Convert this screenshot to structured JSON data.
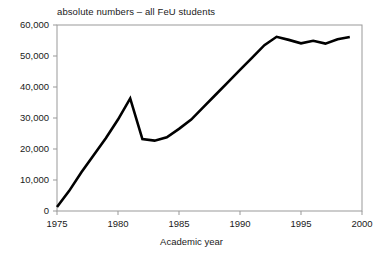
{
  "chart_data": {
    "type": "line",
    "title": "absolute numbers – all FeU students",
    "xlabel": "Academic year",
    "ylabel": "",
    "xlim": [
      1975,
      2000
    ],
    "ylim": [
      0,
      60000
    ],
    "grid": false,
    "legend": "none",
    "xticks": [
      1975,
      1980,
      1985,
      1990,
      1995,
      2000
    ],
    "xtick_labels": [
      "1975",
      "1980",
      "1985",
      "1990",
      "1995",
      "2000"
    ],
    "yticks": [
      0,
      10000,
      20000,
      30000,
      40000,
      50000,
      60000
    ],
    "ytick_labels": [
      "0",
      "10,000",
      "20,000",
      "30,000",
      "40,000",
      "50,000",
      "60,000"
    ],
    "line_color": "#000000",
    "line_width": 2.6,
    "x": [
      1975,
      1976,
      1977,
      1978,
      1979,
      1980,
      1981,
      1982,
      1983,
      1984,
      1985,
      1986,
      1987,
      1988,
      1989,
      1990,
      1991,
      1992,
      1993,
      1994,
      1995,
      1996,
      1997,
      1998,
      1999
    ],
    "values": [
      1300,
      6500,
      12500,
      18000,
      23500,
      29500,
      36300,
      23200,
      22700,
      23800,
      26500,
      29500,
      33500,
      37500,
      41500,
      45500,
      49500,
      53500,
      56200,
      55200,
      54100,
      54900,
      54000,
      55400,
      56100
    ],
    "series": [
      {
        "name": "all FeU students",
        "values": [
          1300,
          6500,
          12500,
          18000,
          23500,
          29500,
          36300,
          23200,
          22700,
          23800,
          26500,
          29500,
          33500,
          37500,
          41500,
          45500,
          49500,
          53500,
          56200,
          55200,
          54100,
          54900,
          54000,
          55400,
          56100
        ]
      }
    ],
    "annotations": []
  },
  "axes": {
    "frame_color": "#999999",
    "tick_color": "#999999"
  }
}
